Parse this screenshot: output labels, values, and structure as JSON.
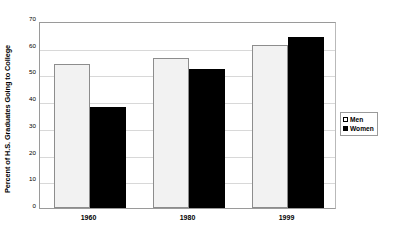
{
  "chart_data": {
    "type": "bar",
    "title": "",
    "xlabel": "",
    "ylabel": "Percent of H.S. Graduates Going to College",
    "categories": [
      "1960",
      "1980",
      "1999"
    ],
    "series": [
      {
        "name": "Men",
        "values": [
          54,
          56,
          61
        ]
      },
      {
        "name": "Women",
        "values": [
          38,
          52,
          64
        ]
      }
    ],
    "ylim": [
      0,
      70
    ],
    "yticks": [
      0,
      10,
      20,
      30,
      40,
      50,
      60,
      70
    ],
    "ytick_labels": [
      "0",
      "10",
      "20",
      "30",
      "40",
      "50",
      "60",
      "70"
    ],
    "grid": true,
    "legend_position": "right"
  },
  "legend": {
    "items": [
      {
        "label": "Men",
        "swatch": "men-swatch"
      },
      {
        "label": "Women",
        "swatch": "women-swatch"
      }
    ]
  },
  "colors": {
    "men_fill": "#f2f2f2",
    "men_border": "#8d8d8d",
    "women_fill": "#000000",
    "gridline": "#d8d8d8",
    "axis": "#9a9a9a",
    "background": "#ffffff"
  }
}
